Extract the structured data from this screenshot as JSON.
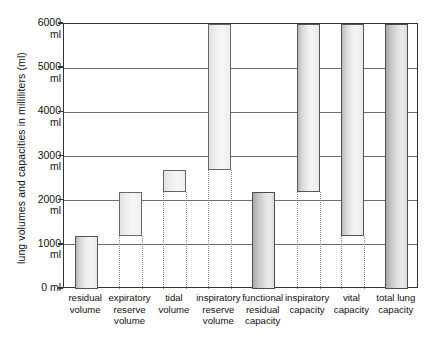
{
  "chart_data": {
    "type": "bar",
    "title": "",
    "subtitle": "",
    "xlabel": "",
    "ylabel": "lung volumes and capacities in milliliters (ml)",
    "ylim": [
      0,
      6000
    ],
    "grid": true,
    "legend": "none",
    "units": "ml",
    "note": "Floating (range) bars: each bar spans from its base value to its top value on the volume axis.",
    "yticks": [
      {
        "value": 6000,
        "label_number": "6000",
        "label_unit": "ml",
        "single_line": false
      },
      {
        "value": 5000,
        "label_number": "5000",
        "label_unit": "ml",
        "single_line": false
      },
      {
        "value": 4000,
        "label_number": "4000",
        "label_unit": "ml",
        "single_line": false
      },
      {
        "value": 3000,
        "label_number": "3000",
        "label_unit": "ml",
        "single_line": false
      },
      {
        "value": 2000,
        "label_number": "2000",
        "label_unit": "ml",
        "single_line": false
      },
      {
        "value": 1000,
        "label_number": "1000",
        "label_unit": "ml",
        "single_line": false
      },
      {
        "value": 0,
        "label_number": "0",
        "label_unit": "ml",
        "single_line": true
      }
    ],
    "categories": [
      "residual volume",
      "expiratory reserve volume",
      "tidal volume",
      "inspiratory reserve volume",
      "functional residual capacity",
      "inspiratory capacity",
      "vital capacity",
      "total lung capacity"
    ],
    "bars": [
      {
        "name": "residual volume",
        "label_lines": [
          "residual",
          "volume"
        ],
        "base": 0,
        "top": 1200,
        "value": 1200,
        "shade": "normal"
      },
      {
        "name": "expiratory reserve volume",
        "label_lines": [
          "expiratory",
          "reserve",
          "volume"
        ],
        "base": 1200,
        "top": 2200,
        "value": 1000,
        "shade": "light"
      },
      {
        "name": "tidal volume",
        "label_lines": [
          "tidal",
          "volume"
        ],
        "base": 2200,
        "top": 2700,
        "value": 500,
        "shade": "light"
      },
      {
        "name": "inspiratory reserve volume",
        "label_lines": [
          "inspiratory",
          "reserve",
          "volume"
        ],
        "base": 2700,
        "top": 6000,
        "value": 3300,
        "shade": "light"
      },
      {
        "name": "functional residual capacity",
        "label_lines": [
          "functional",
          "residual",
          "capacity"
        ],
        "base": 0,
        "top": 2200,
        "value": 2200,
        "shade": "dark"
      },
      {
        "name": "inspiratory capacity",
        "label_lines": [
          "inspiratory",
          "capacity"
        ],
        "base": 2200,
        "top": 6000,
        "value": 3800,
        "shade": "normal"
      },
      {
        "name": "vital capacity",
        "label_lines": [
          "vital",
          "capacity"
        ],
        "base": 1200,
        "top": 6000,
        "value": 4800,
        "shade": "normal"
      },
      {
        "name": "total lung capacity",
        "label_lines": [
          "total lung",
          "capacity"
        ],
        "base": 0,
        "top": 6000,
        "value": 6000,
        "shade": "dark"
      }
    ]
  },
  "colors": {
    "frame": "#333333",
    "gridline": "#6d6d6d",
    "bar_outline": "#555555",
    "bar_fill_light": "#f2f2f2",
    "bar_fill_dark": "#c3c3c3",
    "guide": "#8a8a8a",
    "text": "#111111",
    "background": "#ffffff"
  }
}
